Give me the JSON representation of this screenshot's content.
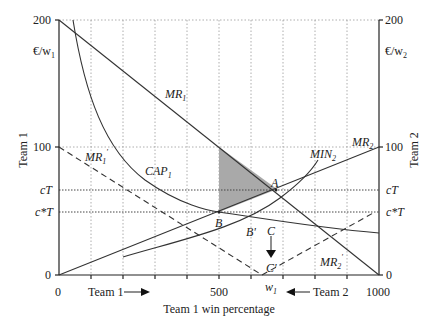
{
  "diagram": {
    "axes": {
      "left_top": "200",
      "left_mid": "100",
      "left_zero": "0",
      "right_top": "200",
      "right_mid": "100",
      "right_zero": "0",
      "left_unit": "€/w",
      "left_unit_sub": "1",
      "right_unit": "€/w",
      "right_unit_sub": "2",
      "left_title": "Team 1",
      "right_title": "Team 2",
      "x_0": "0",
      "x_500": "500",
      "x_1000": "1000",
      "x_title": "Team 1 win percentage",
      "team1_arrow": "Team  1",
      "team2_arrow": "Team  2",
      "w1": "w",
      "w1_sub": "1"
    },
    "levels": {
      "cT": "cT",
      "cstarT": "c*T"
    },
    "curves": {
      "MR1": "MR",
      "MR1_sub": "1",
      "MR1p": "MR",
      "MR1p_sub": "1",
      "MR1p_prime": "'",
      "CAP1": "CAP",
      "CAP1_sub": "1",
      "MIN2": "MIN",
      "MIN2_sub": "2",
      "MR2": "MR",
      "MR2_sub": "2",
      "MR2p": "MR",
      "MR2p_sub": "2",
      "MR2p_prime": "'"
    },
    "points": {
      "A": "A",
      "B": "B",
      "Bp": "B'",
      "C": "C",
      "Cp": "C'"
    },
    "colors": {
      "shade": "#a9a9a9",
      "line": "#333333"
    }
  }
}
